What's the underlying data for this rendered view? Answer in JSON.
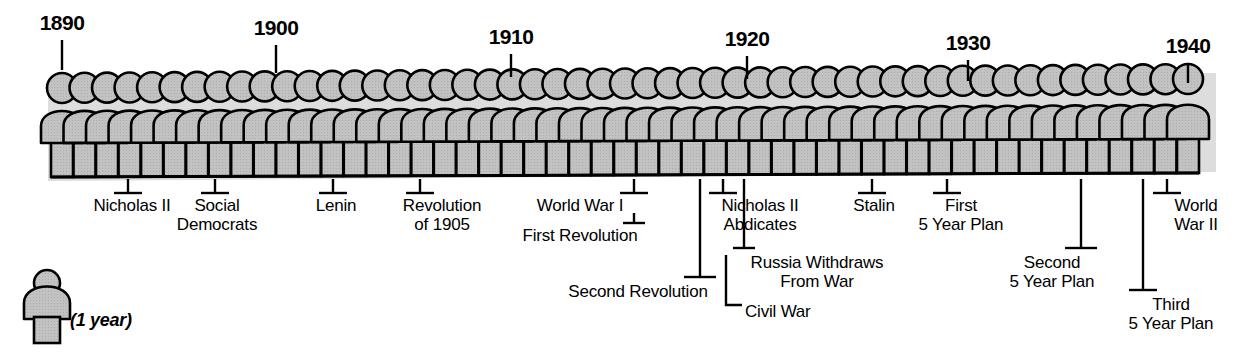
{
  "figure": {
    "caption": "Timeline of Russia 1890-1940",
    "unit_note": "(1 year)"
  },
  "chart_data": {
    "type": "timeline",
    "xlabel": "Year",
    "ylabel": "",
    "unit": "1 figure = 1 year",
    "x_range": [
      1890,
      1940
    ],
    "figure_count": 51,
    "axis_ticks": [
      {
        "year": 1890,
        "label": "1890",
        "x": 62
      },
      {
        "year": 1900,
        "label": "1900",
        "x": 276
      },
      {
        "year": 1910,
        "label": "1910",
        "x": 511
      },
      {
        "year": 1920,
        "label": "1920",
        "x": 747
      },
      {
        "year": 1930,
        "label": "1930",
        "x": 968
      },
      {
        "year": 1940,
        "label": "1940",
        "x": 1188
      }
    ],
    "events": [
      {
        "label": "Nicholas II",
        "year": 1893,
        "x": 128
      },
      {
        "label": "Social Democrats",
        "year": 1897,
        "x": 215
      },
      {
        "label": "Lenin",
        "year": 1902,
        "x": 333
      },
      {
        "label": "Revolution of 1905",
        "year": 1906,
        "x": 420
      },
      {
        "label": "World War I",
        "year": 1915,
        "x": 634
      },
      {
        "label": "First Revolution",
        "year": 1915,
        "x": 634
      },
      {
        "label": "Second Revolution",
        "year": 1918,
        "x": 700
      },
      {
        "label": "Nicholas II Abdicates",
        "year": 1919,
        "x": 723
      },
      {
        "label": "Russia Withdraws From War",
        "year": 1920,
        "x": 744
      },
      {
        "label": "Civil War",
        "year": 1920,
        "x": 744
      },
      {
        "label": "Stalin",
        "year": 1926,
        "x": 872
      },
      {
        "label": "First 5 Year Plan",
        "year": 1929,
        "x": 947
      },
      {
        "label": "Second 5 Year Plan",
        "year": 1935,
        "x": 1081
      },
      {
        "label": "Third 5 Year Plan",
        "year": 1938,
        "x": 1143
      },
      {
        "label": "World War II",
        "year": 1939,
        "x": 1167
      }
    ]
  },
  "years": [
    {
      "text": "1890",
      "x": 62,
      "y": 12,
      "tick_top": 40,
      "tick_bottom": 70
    },
    {
      "text": "1900",
      "x": 276,
      "y": 17,
      "tick_top": 45,
      "tick_bottom": 73
    },
    {
      "text": "1910",
      "x": 511,
      "y": 26,
      "tick_top": 54,
      "tick_bottom": 77
    },
    {
      "text": "1920",
      "x": 747,
      "y": 28,
      "tick_top": 56,
      "tick_bottom": 79
    },
    {
      "text": "1930",
      "x": 968,
      "y": 32,
      "tick_top": 60,
      "tick_bottom": 81
    },
    {
      "text": "1940",
      "x": 1188,
      "y": 35,
      "tick_top": 63,
      "tick_bottom": 83
    }
  ],
  "events": [
    {
      "id": "nicholas-ii",
      "lines": [
        "Nicholas II"
      ],
      "align": "c",
      "text_x": 132,
      "text_y": 196,
      "stem_x": 128,
      "stem_top": 179,
      "stem_bottom": 193,
      "foot_half": 14,
      "foot_y": 193
    },
    {
      "id": "social-democrats",
      "lines": [
        "Social",
        "Democrats"
      ],
      "align": "c",
      "text_x": 217,
      "text_y": 196,
      "stem_x": 215,
      "stem_top": 179,
      "stem_bottom": 193,
      "foot_half": 14,
      "foot_y": 193
    },
    {
      "id": "lenin",
      "lines": [
        "Lenin"
      ],
      "align": "c",
      "text_x": 336,
      "text_y": 196,
      "stem_x": 333,
      "stem_top": 179,
      "stem_bottom": 193,
      "foot_half": 14,
      "foot_y": 193
    },
    {
      "id": "revolution-of-1905",
      "lines": [
        "Revolution",
        "of 1905"
      ],
      "align": "c",
      "text_x": 442,
      "text_y": 196,
      "stem_x": 420,
      "stem_top": 179,
      "stem_bottom": 193,
      "foot_half": 14,
      "foot_y": 193
    },
    {
      "id": "world-war-i",
      "lines": [
        "World War I"
      ],
      "align": "c",
      "text_x": 580,
      "text_y": 196,
      "stem_x": 634,
      "stem_top": 179,
      "stem_bottom": 193,
      "foot_half": 14,
      "foot_y": 193
    },
    {
      "id": "first-revolution",
      "lines": [
        "First Revolution"
      ],
      "align": "c",
      "text_x": 580,
      "text_y": 226,
      "stem_x": 634,
      "stem_top": 213,
      "stem_bottom": 223,
      "foot_half": 11,
      "foot_y": 223
    },
    {
      "id": "second-revolution",
      "lines": [
        "Second Revolution"
      ],
      "align": "c",
      "text_x": 638,
      "text_y": 282,
      "stem_x": 700,
      "stem_top": 179,
      "stem_bottom": 277,
      "foot_half": 16,
      "foot_y": 277
    },
    {
      "id": "nicholas-ii-abdicates",
      "lines": [
        "Nicholas II",
        "Abdicates"
      ],
      "align": "c",
      "text_x": 760,
      "text_y": 196,
      "stem_x": 723,
      "stem_top": 179,
      "stem_bottom": 193,
      "foot_half": 14,
      "foot_y": 193
    },
    {
      "id": "russia-withdraws-from-war",
      "lines": [
        "Russia Withdraws",
        "From War"
      ],
      "align": "c",
      "text_x": 817,
      "text_y": 253,
      "stem_x": 744,
      "stem_top": 179,
      "stem_bottom": 248,
      "foot_half": 11,
      "foot_y": 248
    },
    {
      "id": "civil-war",
      "lines": [
        "Civil War"
      ],
      "align": "l",
      "text_x": 745,
      "text_y": 302,
      "stem_x": 0,
      "stem_top": 0,
      "stem_bottom": 0,
      "foot_half": 0,
      "foot_y": 0,
      "elbow": {
        "x": 726,
        "top": 255,
        "bottom": 305,
        "right": 742
      }
    },
    {
      "id": "stalin",
      "lines": [
        "Stalin"
      ],
      "align": "c",
      "text_x": 874,
      "text_y": 196,
      "stem_x": 872,
      "stem_top": 179,
      "stem_bottom": 193,
      "foot_half": 14,
      "foot_y": 193
    },
    {
      "id": "first-5-year-plan",
      "lines": [
        "First",
        "5 Year Plan"
      ],
      "align": "c",
      "text_x": 961,
      "text_y": 196,
      "stem_x": 947,
      "stem_top": 179,
      "stem_bottom": 193,
      "foot_half": 14,
      "foot_y": 193
    },
    {
      "id": "second-5-year-plan",
      "lines": [
        "Second",
        "5 Year Plan"
      ],
      "align": "c",
      "text_x": 1052,
      "text_y": 253,
      "stem_x": 1081,
      "stem_top": 179,
      "stem_bottom": 248,
      "foot_half": 16,
      "foot_y": 248
    },
    {
      "id": "third-5-year-plan",
      "lines": [
        "Third",
        "5 Year Plan"
      ],
      "align": "c",
      "text_x": 1171,
      "text_y": 295,
      "stem_x": 1143,
      "stem_top": 179,
      "stem_bottom": 290,
      "foot_half": 14,
      "foot_y": 290
    },
    {
      "id": "world-war-ii",
      "lines": [
        "World",
        "War II"
      ],
      "align": "c",
      "text_x": 1196,
      "text_y": 196,
      "stem_x": 1167,
      "stem_top": 179,
      "stem_bottom": 193,
      "foot_half": 14,
      "foot_y": 193
    }
  ],
  "legend": {
    "note": "(1 year)",
    "note_x": 70,
    "note_y": 310
  },
  "style": {
    "fill": "#c2c2c2",
    "stroke": "#000000",
    "shadow": "#b4b4b4",
    "background": "#ffffff"
  },
  "geometry": {
    "first_center_x": 62,
    "pitch": 22.52,
    "count": 51,
    "head_r": 15,
    "head_cy": 88,
    "shoulder_top": 110,
    "shoulder_w": 21,
    "body_top": 142,
    "body_bottom": 177,
    "body_w": 22
  }
}
